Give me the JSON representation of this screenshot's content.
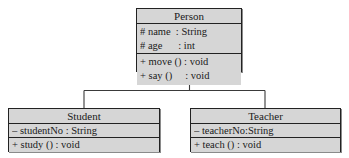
{
  "diagram": {
    "type": "uml-class-diagram",
    "relationship": "generalization",
    "classes": [
      {
        "id": "person",
        "name": "Person",
        "attributes": [
          "# name  : String",
          "# age      : int"
        ],
        "operations": [
          "+ move () : void",
          "+ say ()     : void"
        ]
      },
      {
        "id": "student",
        "name": "Student",
        "attributes": [
          "– studentNo : String"
        ],
        "operations": [
          "+ study () : void"
        ]
      },
      {
        "id": "teacher",
        "name": "Teacher",
        "attributes": [
          "– teacherNo:String"
        ],
        "operations": [
          "+ teach () : void"
        ]
      }
    ],
    "generalizations": [
      {
        "child": "student",
        "parent": "person",
        "arrow": "hollow-triangle"
      },
      {
        "child": "teacher",
        "parent": "person",
        "arrow": "hollow-triangle"
      }
    ],
    "colors": {
      "box_fill": "#d6d6d6",
      "box_border": "#222222",
      "text": "#1a1a1a",
      "line": "#3a3a3a",
      "background": "#ffffff"
    }
  }
}
